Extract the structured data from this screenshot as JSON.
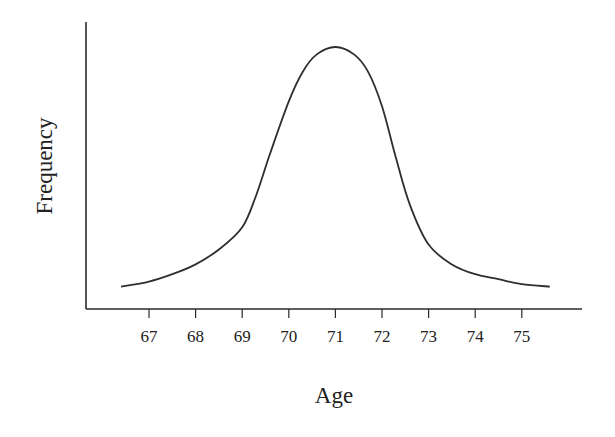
{
  "chart_data": {
    "type": "line",
    "title": "",
    "xlabel": "Age",
    "ylabel": "Frequency",
    "x_ticks": [
      67,
      68,
      69,
      70,
      71,
      72,
      73,
      74,
      75
    ],
    "xlim": [
      66.3,
      75.7
    ],
    "y_ticks": [],
    "grid": false,
    "legend": null,
    "series": [
      {
        "name": "Age distribution",
        "description": "Bell-shaped (approximately normal) frequency curve centered at age 71",
        "x": [
          66.4,
          67.0,
          67.5,
          68.0,
          68.5,
          69.0,
          69.3,
          69.6,
          70.0,
          70.3,
          70.6,
          71.0,
          71.4,
          71.7,
          72.0,
          72.3,
          72.6,
          73.0,
          73.5,
          74.0,
          74.5,
          75.0,
          75.6
        ],
        "values": [
          0.03,
          0.05,
          0.08,
          0.12,
          0.18,
          0.27,
          0.4,
          0.57,
          0.78,
          0.9,
          0.97,
          1.0,
          0.97,
          0.9,
          0.76,
          0.55,
          0.36,
          0.2,
          0.12,
          0.08,
          0.06,
          0.04,
          0.03
        ]
      }
    ]
  }
}
